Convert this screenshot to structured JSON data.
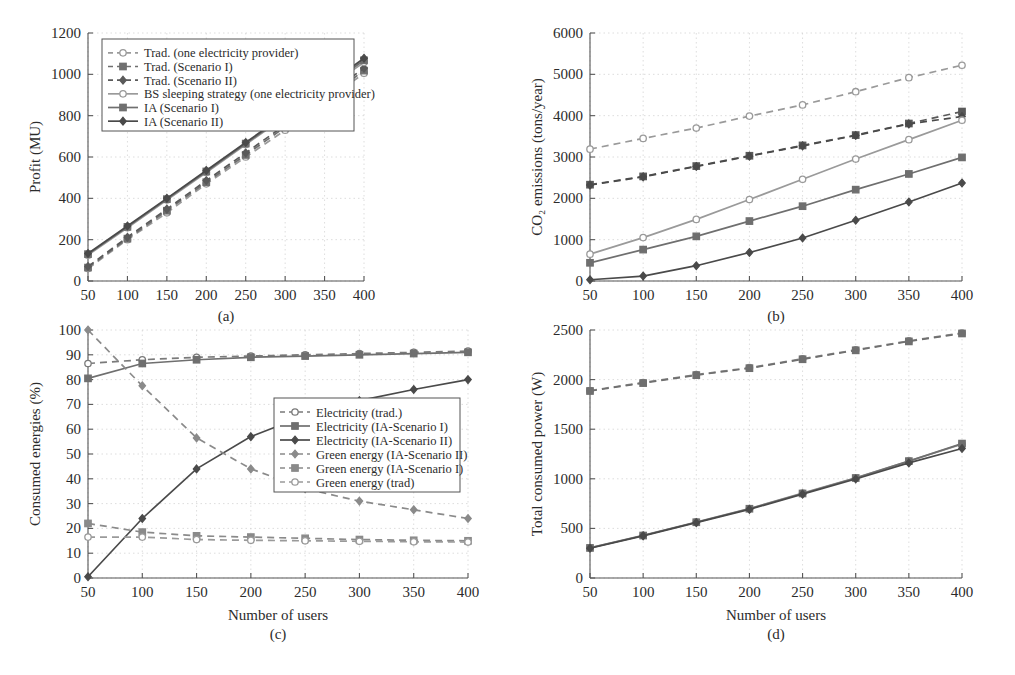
{
  "figure": {
    "background": "#ffffff",
    "ink": "#2b2b2b",
    "grid_color": "#cfcfcf",
    "x_values": [
      50,
      100,
      150,
      200,
      250,
      300,
      350,
      400
    ]
  },
  "chart_data": [
    {
      "id": "a",
      "type": "line",
      "title": "",
      "caption": "(a)",
      "xlabel": "",
      "ylabel": "Profit (MU)",
      "x": [
        50,
        100,
        150,
        200,
        250,
        300,
        350,
        400
      ],
      "xticks": [
        50,
        100,
        150,
        200,
        250,
        300,
        350,
        400
      ],
      "yticks": [
        0,
        200,
        400,
        600,
        800,
        1000,
        1200
      ],
      "xlim": [
        50,
        400
      ],
      "ylim": [
        0,
        1200
      ],
      "grid": true,
      "legend_position": "upper-left",
      "series": [
        {
          "name": "Trad. (one electricity provider)",
          "style": "dashed",
          "marker": "circle-open",
          "color": "#9a9a9a",
          "values": [
            60,
            200,
            330,
            470,
            600,
            730,
            870,
            1005
          ]
        },
        {
          "name": "Trad. (Scenario I)",
          "style": "dashed",
          "marker": "square",
          "color": "#6f6f6f",
          "values": [
            65,
            205,
            340,
            478,
            610,
            745,
            880,
            1018
          ]
        },
        {
          "name": "Trad. (Scenario II)",
          "style": "dashed",
          "marker": "diamond",
          "color": "#5a5a5a",
          "values": [
            70,
            212,
            348,
            486,
            620,
            755,
            890,
            1030
          ]
        },
        {
          "name": "BS sleeping strategy (one electricity provider)",
          "style": "solid",
          "marker": "circle-open",
          "color": "#9a9a9a",
          "values": [
            125,
            258,
            392,
            525,
            660,
            795,
            925,
            1058
          ]
        },
        {
          "name": "IA (Scenario I)",
          "style": "solid",
          "marker": "square",
          "color": "#6f6f6f",
          "values": [
            130,
            262,
            396,
            530,
            665,
            800,
            932,
            1068
          ]
        },
        {
          "name": "IA (Scenario II)",
          "style": "solid",
          "marker": "diamond",
          "color": "#4a4a4a",
          "values": [
            133,
            266,
            400,
            535,
            670,
            806,
            940,
            1078
          ]
        }
      ]
    },
    {
      "id": "b",
      "type": "line",
      "title": "",
      "caption": "(b)",
      "xlabel": "",
      "ylabel": "CO₂ emissions (tons/year)",
      "x": [
        50,
        100,
        150,
        200,
        250,
        300,
        350,
        400
      ],
      "xticks": [
        50,
        100,
        150,
        200,
        250,
        300,
        350,
        400
      ],
      "yticks": [
        0,
        1000,
        2000,
        3000,
        4000,
        5000,
        6000
      ],
      "xlim": [
        50,
        400
      ],
      "ylim": [
        0,
        6000
      ],
      "grid": true,
      "legend_position": "none",
      "series": [
        {
          "name": "Trad. (one electricity provider)",
          "style": "dashed",
          "marker": "circle-open",
          "color": "#9a9a9a",
          "values": [
            3190,
            3450,
            3700,
            3990,
            4260,
            4580,
            4920,
            5220
          ]
        },
        {
          "name": "Trad. (Scenario I)",
          "style": "dashed",
          "marker": "square",
          "color": "#5a5a5a",
          "values": [
            2330,
            2530,
            2780,
            3030,
            3280,
            3530,
            3810,
            4100
          ]
        },
        {
          "name": "Trad. (Scenario II)",
          "style": "dashed",
          "marker": "diamond",
          "color": "#4a4a4a",
          "values": [
            2320,
            2520,
            2770,
            3020,
            3270,
            3520,
            3800,
            3980
          ]
        },
        {
          "name": "BS sleeping strategy (one electricity provider)",
          "style": "solid",
          "marker": "circle-open",
          "color": "#9a9a9a",
          "values": [
            650,
            1050,
            1490,
            1970,
            2460,
            2950,
            3420,
            3890
          ]
        },
        {
          "name": "IA (Scenario I)",
          "style": "solid",
          "marker": "square",
          "color": "#6f6f6f",
          "values": [
            440,
            760,
            1080,
            1450,
            1810,
            2210,
            2590,
            2990
          ]
        },
        {
          "name": "IA (Scenario II)",
          "style": "solid",
          "marker": "diamond",
          "color": "#4a4a4a",
          "values": [
            30,
            120,
            370,
            690,
            1040,
            1470,
            1910,
            2370
          ]
        }
      ]
    },
    {
      "id": "c",
      "type": "line",
      "title": "",
      "caption": "(c)",
      "xlabel": "Number of users",
      "ylabel": "Consumed energies (%)",
      "x": [
        50,
        100,
        150,
        200,
        250,
        300,
        350,
        400
      ],
      "xticks": [
        50,
        100,
        150,
        200,
        250,
        300,
        350,
        400
      ],
      "yticks": [
        0,
        10,
        20,
        30,
        40,
        50,
        60,
        70,
        80,
        90,
        100
      ],
      "xlim": [
        50,
        400
      ],
      "ylim": [
        0,
        100
      ],
      "grid": true,
      "legend_position": "center-right",
      "series": [
        {
          "name": "Electricity (trad.)",
          "style": "dashed",
          "marker": "circle-open",
          "color": "#7a7a7a",
          "values": [
            86.5,
            88,
            89,
            89.5,
            90,
            90.5,
            91,
            91.5
          ]
        },
        {
          "name": "Electricity (IA-Scenario I)",
          "style": "solid",
          "marker": "square",
          "color": "#6f6f6f",
          "values": [
            80.5,
            86.5,
            88,
            89,
            89.5,
            90,
            90.5,
            91
          ]
        },
        {
          "name": "Electricity (IA-Scenario II)",
          "style": "solid",
          "marker": "diamond",
          "color": "#4a4a4a",
          "values": [
            0.5,
            24,
            44,
            57,
            65.5,
            71.5,
            76,
            80
          ]
        },
        {
          "name": "Green energy (IA-Scenario II)",
          "style": "dashed",
          "marker": "diamond",
          "color": "#8a8a8a",
          "values": [
            100,
            77.5,
            56.5,
            44,
            36,
            31,
            27.5,
            24
          ]
        },
        {
          "name": "Green energy (IA-Scenario I)",
          "style": "dashed",
          "marker": "square",
          "color": "#8a8a8a",
          "values": [
            22,
            18.5,
            17,
            16.5,
            16,
            15.5,
            15.2,
            15
          ]
        },
        {
          "name": "Green energy (trad)",
          "style": "dashed",
          "marker": "circle-open",
          "color": "#9a9a9a",
          "values": [
            16.5,
            16.5,
            15.5,
            15.2,
            15,
            14.8,
            14.6,
            14.5
          ]
        }
      ]
    },
    {
      "id": "d",
      "type": "line",
      "title": "",
      "caption": "(d)",
      "xlabel": "Number of users",
      "ylabel": "Total consumed power (W)",
      "x": [
        50,
        100,
        150,
        200,
        250,
        300,
        350,
        400
      ],
      "xticks": [
        50,
        100,
        150,
        200,
        250,
        300,
        350,
        400
      ],
      "yticks": [
        0,
        500,
        1000,
        1500,
        2000,
        2500
      ],
      "xlim": [
        50,
        400
      ],
      "ylim": [
        0,
        2500
      ],
      "grid": true,
      "legend_position": "none",
      "series": [
        {
          "name": "Trad. (one electricity provider)",
          "style": "dashed",
          "marker": "circle-open",
          "color": "#8a8a8a",
          "values": [
            1890,
            1970,
            2050,
            2120,
            2210,
            2300,
            2390,
            2470
          ]
        },
        {
          "name": "Trad. (Scenario I)",
          "style": "dashed",
          "marker": "square",
          "color": "#6f6f6f",
          "values": [
            1885,
            1965,
            2045,
            2115,
            2205,
            2295,
            2385,
            2465
          ]
        },
        {
          "name": "BS sleeping strategy (one electricity provider)",
          "style": "solid",
          "marker": "circle-open",
          "color": "#9a9a9a",
          "values": [
            305,
            430,
            565,
            700,
            855,
            1010,
            1180,
            1350
          ]
        },
        {
          "name": "IA (Scenario I)",
          "style": "solid",
          "marker": "square",
          "color": "#6f6f6f",
          "values": [
            303,
            428,
            562,
            698,
            852,
            1008,
            1178,
            1355
          ]
        },
        {
          "name": "IA (Scenario II)",
          "style": "solid",
          "marker": "diamond",
          "color": "#4a4a4a",
          "values": [
            300,
            425,
            558,
            692,
            845,
            998,
            1160,
            1305
          ]
        }
      ]
    }
  ],
  "legends": {
    "a": {
      "items": [
        "Trad. (one electricity provider)",
        "Trad. (Scenario I)",
        "Trad. (Scenario II)",
        "BS sleeping strategy (one electricity provider)",
        "IA (Scenario I)",
        "IA (Scenario II)"
      ]
    },
    "c": {
      "items": [
        "Electricity (trad.)",
        "Electricity (IA-Scenario I)",
        "Electricity (IA-Scenario II)",
        "Green energy (IA-Scenario II)",
        "Green energy (IA-Scenario I)",
        "Green energy (trad)"
      ]
    }
  }
}
